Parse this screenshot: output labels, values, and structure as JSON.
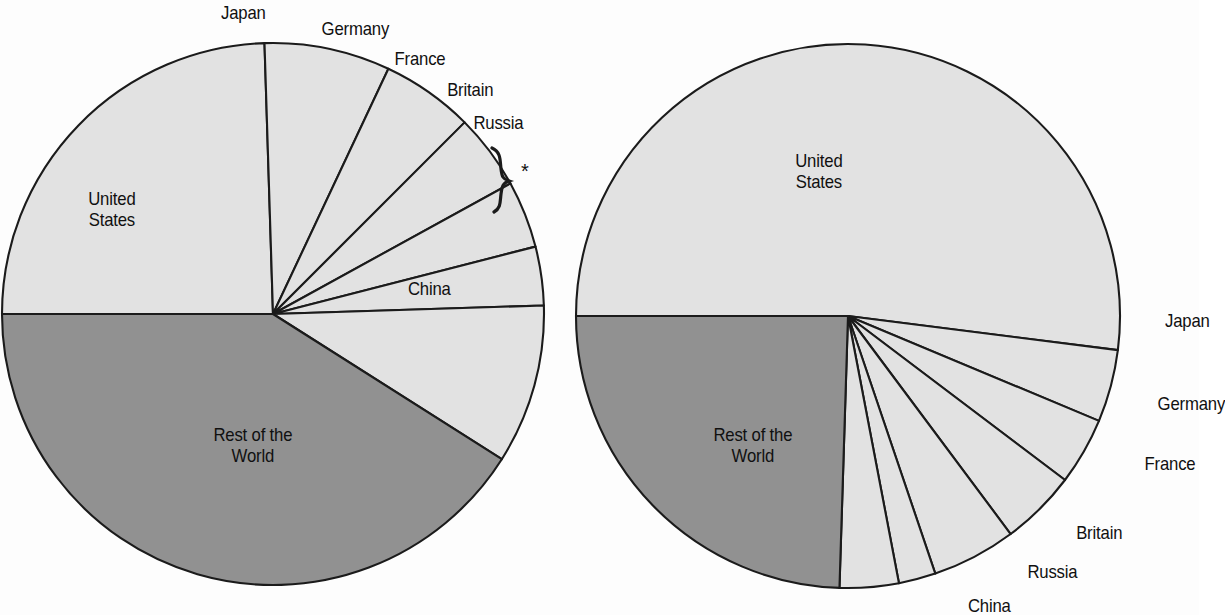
{
  "figure": {
    "background_color": "#fdfdfd",
    "ink_color": "#101010",
    "slice_light_color": "#e2e2e2",
    "slice_dark_color": "#919191",
    "footnote_marker": "*"
  },
  "chart_data": [
    {
      "type": "pie",
      "name": "left-pie",
      "title": "",
      "center": [
        273,
        314
      ],
      "radius": 271,
      "start_angle_deg": 180,
      "direction": "clockwise",
      "categories": [
        "United States",
        "Japan",
        "Germany",
        "France",
        "Britain",
        "Russia",
        "China",
        "Rest of the World"
      ],
      "values": [
        24.5,
        7.5,
        5.5,
        4.5,
        4.0,
        3.5,
        9.5,
        41.0
      ],
      "labels": [
        {
          "key": "united_states",
          "text": "United\nStates",
          "x": 85,
          "y": 188,
          "align": "center"
        },
        {
          "key": "japan",
          "text": "Japan",
          "x": 218,
          "y": 2,
          "align": "center"
        },
        {
          "key": "germany",
          "text": "Germany",
          "x": 317,
          "y": 18,
          "align": "center"
        },
        {
          "key": "france",
          "text": "France",
          "x": 391,
          "y": 48,
          "align": "center"
        },
        {
          "key": "britain",
          "text": "Britain",
          "x": 444,
          "y": 79,
          "align": "center"
        },
        {
          "key": "russia",
          "text": "Russia",
          "x": 470,
          "y": 112,
          "align": "center"
        },
        {
          "key": "china",
          "text": "China",
          "x": 405,
          "y": 278,
          "align": "center"
        },
        {
          "key": "rest_of_the_world",
          "text": "Rest of the\nWorld",
          "x": 208,
          "y": 424,
          "align": "center"
        }
      ],
      "annotation": {
        "marker": "*",
        "x": 521,
        "y": 160,
        "brace_spans": "Russia"
      }
    },
    {
      "type": "pie",
      "name": "right-pie",
      "title": "",
      "center": [
        848,
        316
      ],
      "radius": 272,
      "start_angle_deg": 180,
      "direction": "clockwise",
      "categories": [
        "United States",
        "Japan",
        "Germany",
        "France",
        "Britain",
        "Russia",
        "China",
        "Rest of the World"
      ],
      "values": [
        52.0,
        4.3,
        4.0,
        4.5,
        5.0,
        2.2,
        3.5,
        24.5
      ],
      "labels": [
        {
          "key": "united_states",
          "text": "United\nStates",
          "x": 792,
          "y": 150,
          "align": "center"
        },
        {
          "key": "japan",
          "text": "Japan",
          "x": 1162,
          "y": 310,
          "align": "center"
        },
        {
          "key": "germany",
          "text": "Germany",
          "x": 1153,
          "y": 393,
          "align": "center"
        },
        {
          "key": "france",
          "text": "France",
          "x": 1141,
          "y": 453,
          "align": "center"
        },
        {
          "key": "britain",
          "text": "Britain",
          "x": 1073,
          "y": 522,
          "align": "center"
        },
        {
          "key": "russia",
          "text": "Russia",
          "x": 1024,
          "y": 561,
          "align": "center"
        },
        {
          "key": "china",
          "text": "China",
          "x": 965,
          "y": 595,
          "align": "center"
        },
        {
          "key": "rest_of_the_world",
          "text": "Rest of the\nWorld",
          "x": 708,
          "y": 424,
          "align": "center"
        }
      ]
    }
  ]
}
